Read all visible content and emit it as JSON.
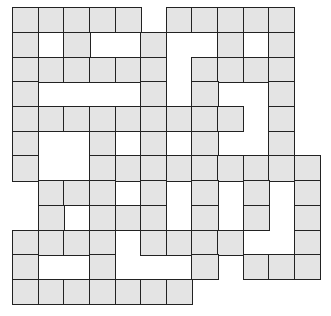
{
  "puzzle": {
    "type": "crossword-style grid",
    "rows": 12,
    "cols": 12,
    "cell_width": 25.6,
    "cell_height": 24.7,
    "cell_fill": "#e4e4e4",
    "border_color": "#222222",
    "filled_cells_by_row": [
      [
        0,
        1,
        2,
        3,
        4,
        6,
        7,
        8,
        9,
        10
      ],
      [
        0,
        2,
        5,
        8,
        10
      ],
      [
        0,
        1,
        2,
        3,
        4,
        5,
        7,
        8,
        9,
        10
      ],
      [
        0,
        5,
        7,
        10
      ],
      [
        0,
        1,
        2,
        3,
        4,
        5,
        6,
        7,
        8,
        10
      ],
      [
        0,
        3,
        5,
        7,
        10
      ],
      [
        0,
        3,
        4,
        5,
        6,
        7,
        8,
        9,
        10,
        11
      ],
      [
        1,
        2,
        3,
        5,
        7,
        9,
        11
      ],
      [
        1,
        3,
        4,
        5,
        7,
        9,
        11
      ],
      [
        0,
        1,
        2,
        3,
        5,
        6,
        7,
        8,
        11
      ],
      [
        0,
        3,
        7,
        9,
        10,
        11
      ],
      [
        0,
        1,
        2,
        3,
        4,
        5,
        6
      ]
    ]
  }
}
